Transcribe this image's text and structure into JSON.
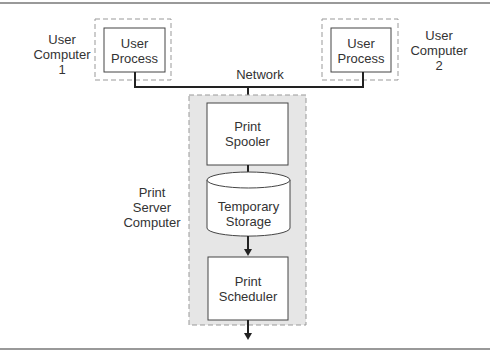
{
  "diagram": {
    "network_label": "Network",
    "user_computer_1": {
      "label_lines": [
        "User",
        "Computer",
        "1"
      ],
      "process_lines": [
        "User",
        "Process"
      ]
    },
    "user_computer_2": {
      "label_lines": [
        "User",
        "Computer",
        "2"
      ],
      "process_lines": [
        "User",
        "Process"
      ]
    },
    "print_server": {
      "label_lines": [
        "Print",
        "Server",
        "Computer"
      ],
      "spooler_lines": [
        "Print",
        "Spooler"
      ],
      "storage_lines": [
        "Temporary",
        "Storage"
      ],
      "scheduler_lines": [
        "Print",
        "Scheduler"
      ]
    },
    "colors": {
      "server_fill": "#e6e6e6",
      "line": "#222222",
      "dash": "#999999"
    }
  }
}
